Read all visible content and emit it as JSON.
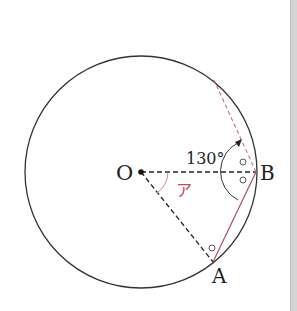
{
  "diagram": {
    "type": "circle-geometry",
    "center_label": "O",
    "points": {
      "O": "O",
      "A": "A",
      "B": "B"
    },
    "angle_label": "130°",
    "unknown_angle_label": "ア",
    "equal_angle_mark": "○",
    "colors": {
      "circle": "#333333",
      "radius_dashed": "#222222",
      "chord": "#b5485f",
      "chord_dashed": "#c86a7f",
      "angle_label_unknown": "#c0485f"
    }
  }
}
